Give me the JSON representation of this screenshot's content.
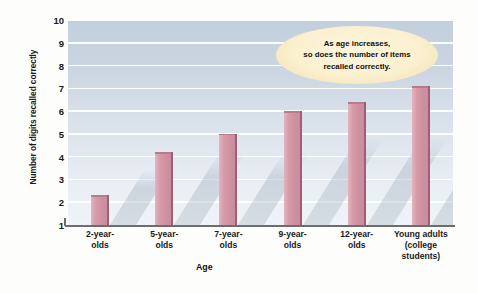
{
  "chart_data": {
    "type": "bar",
    "title": "",
    "xlabel": "Age",
    "ylabel": "Number of digits recalled correctly",
    "categories": [
      "2-year-\nolds",
      "5-year-\nolds",
      "7-year-\nolds",
      "9-year-\nolds",
      "12-year-\nolds",
      "Young adults\n(college\nstudents)"
    ],
    "values": [
      2.3,
      4.2,
      5.0,
      6.0,
      6.4,
      7.1
    ],
    "ylim": [
      1,
      10
    ],
    "yticks": [
      1,
      2,
      3,
      4,
      5,
      6,
      7,
      8,
      9,
      10
    ],
    "ytick_labels": [
      "1",
      "2",
      "3",
      "4",
      "5",
      "6",
      "7",
      "8",
      "9",
      "10"
    ],
    "grid": true,
    "legend": "none",
    "annotations": [
      {
        "text": "As age increases,\nso does  the number of items\nrecalled correctly.",
        "shape": "ellipse"
      }
    ],
    "colors": {
      "bar_fill": "#d79aa9",
      "bar_edge": "#9c5f74",
      "plot_background_top": "#c3cfdd",
      "plot_background_bottom": "#f0f4f8",
      "gridline": "#ffffff",
      "axis_line": "#6d6d6d",
      "annotation_fill": "#fbf0cf",
      "annotation_border": "#ecd9a6",
      "text": "#1a1a1a",
      "figure_background": "#fdfdfb"
    }
  }
}
